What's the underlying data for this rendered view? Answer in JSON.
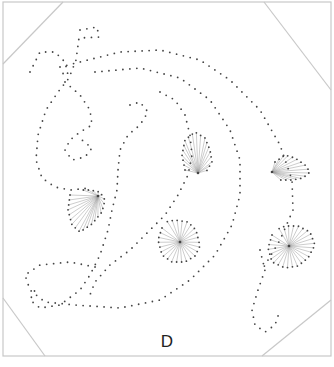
{
  "pattern": {
    "letter_label": "D",
    "colors": {
      "frame": "#c8c8c8",
      "dot": "#444444",
      "thread": "#9a9a9a",
      "background": "#ffffff"
    },
    "frame": {
      "x": 3,
      "y": 2,
      "w": 328,
      "h": 354,
      "corner_cuts": [
        [
          [
            3,
            64
          ],
          [
            63,
            2
          ]
        ],
        [
          [
            264,
            2
          ],
          [
            331,
            90
          ]
        ],
        [
          [
            3,
            298
          ],
          [
            45,
            356
          ]
        ],
        [
          [
            331,
            300
          ],
          [
            262,
            356
          ]
        ]
      ]
    },
    "dot_paths": [
      [
        [
          30,
          72
        ],
        [
          40,
          52
        ],
        [
          55,
          52
        ],
        [
          65,
          62
        ],
        [
          68,
          75
        ],
        [
          58,
          72
        ]
      ],
      [
        [
          80,
          30
        ],
        [
          97,
          27
        ],
        [
          99,
          37
        ],
        [
          79,
          38
        ],
        [
          76,
          60
        ],
        [
          69,
          78
        ],
        [
          58,
          92
        ],
        [
          46,
          110
        ],
        [
          38,
          135
        ],
        [
          36,
          160
        ],
        [
          42,
          178
        ],
        [
          55,
          187
        ],
        [
          70,
          190
        ],
        [
          90,
          188
        ]
      ],
      [
        [
          60,
          67
        ],
        [
          120,
          52
        ],
        [
          160,
          50
        ],
        [
          200,
          60
        ],
        [
          230,
          80
        ],
        [
          260,
          110
        ],
        [
          280,
          145
        ],
        [
          292,
          180
        ],
        [
          293,
          210
        ],
        [
          280,
          240
        ],
        [
          262,
          270
        ]
      ],
      [
        [
          95,
          72
        ],
        [
          140,
          68
        ],
        [
          180,
          78
        ],
        [
          210,
          100
        ],
        [
          230,
          130
        ],
        [
          240,
          160
        ],
        [
          240,
          195
        ],
        [
          232,
          225
        ],
        [
          215,
          255
        ],
        [
          190,
          280
        ],
        [
          160,
          300
        ],
        [
          120,
          308
        ],
        [
          75,
          305
        ],
        [
          45,
          302
        ],
        [
          30,
          290
        ],
        [
          25,
          275
        ],
        [
          40,
          265
        ],
        [
          70,
          262
        ],
        [
          100,
          268
        ]
      ],
      [
        [
          65,
          82
        ],
        [
          80,
          95
        ],
        [
          90,
          110
        ],
        [
          92,
          125
        ],
        [
          80,
          132
        ],
        [
          70,
          140
        ],
        [
          65,
          150
        ],
        [
          72,
          160
        ],
        [
          85,
          157
        ],
        [
          92,
          148
        ],
        [
          82,
          140
        ]
      ],
      [
        [
          130,
          105
        ],
        [
          140,
          102
        ],
        [
          148,
          112
        ],
        [
          140,
          125
        ],
        [
          128,
          135
        ],
        [
          120,
          150
        ],
        [
          118,
          170
        ],
        [
          117,
          190
        ],
        [
          112,
          210
        ],
        [
          108,
          230
        ],
        [
          100,
          255
        ],
        [
          90,
          275
        ],
        [
          80,
          290
        ],
        [
          60,
          305
        ],
        [
          40,
          308
        ],
        [
          30,
          300
        ],
        [
          35,
          290
        ]
      ],
      [
        [
          160,
          92
        ],
        [
          175,
          100
        ],
        [
          185,
          115
        ],
        [
          190,
          135
        ],
        [
          192,
          155
        ],
        [
          188,
          175
        ],
        [
          178,
          195
        ],
        [
          165,
          215
        ],
        [
          150,
          230
        ],
        [
          130,
          250
        ],
        [
          110,
          265
        ],
        [
          95,
          282
        ],
        [
          88,
          300
        ]
      ],
      [
        [
          260,
          250
        ],
        [
          265,
          270
        ],
        [
          258,
          290
        ],
        [
          252,
          310
        ],
        [
          255,
          325
        ],
        [
          265,
          332
        ],
        [
          275,
          325
        ],
        [
          280,
          310
        ]
      ]
    ],
    "fan_motifs": [
      {
        "hub": [
          98,
          196
        ],
        "arc": [
          [
            70,
            195
          ],
          [
            68,
            210
          ],
          [
            72,
            225
          ],
          [
            80,
            232
          ],
          [
            92,
            224
          ],
          [
            102,
            212
          ],
          [
            105,
            200
          ],
          [
            100,
            192
          ],
          [
            90,
            190
          ],
          [
            80,
            190
          ]
        ]
      },
      {
        "hub": [
          198,
          173
        ],
        "arc": [
          [
            185,
            170
          ],
          [
            182,
            155
          ],
          [
            185,
            140
          ],
          [
            195,
            132
          ],
          [
            205,
            138
          ],
          [
            210,
            150
          ],
          [
            212,
            162
          ],
          [
            206,
            172
          ]
        ]
      },
      {
        "hub": [
          272,
          172
        ],
        "arc": [
          [
            275,
            162
          ],
          [
            285,
            155
          ],
          [
            295,
            158
          ],
          [
            305,
            165
          ],
          [
            310,
            172
          ],
          [
            303,
            178
          ],
          [
            292,
            180
          ],
          [
            280,
            180
          ]
        ]
      },
      {
        "hub": [
          180,
          242
        ],
        "arc": [
          [
            162,
            228
          ],
          [
            158,
            240
          ],
          [
            162,
            255
          ],
          [
            172,
            262
          ],
          [
            185,
            262
          ],
          [
            195,
            256
          ],
          [
            200,
            246
          ],
          [
            196,
            230
          ],
          [
            188,
            222
          ],
          [
            175,
            220
          ],
          [
            165,
            222
          ]
        ]
      },
      {
        "hub": [
          289,
          246
        ],
        "arc": [
          [
            272,
            235
          ],
          [
            268,
            248
          ],
          [
            272,
            262
          ],
          [
            285,
            268
          ],
          [
            298,
            266
          ],
          [
            308,
            258
          ],
          [
            315,
            245
          ],
          [
            310,
            232
          ],
          [
            298,
            226
          ],
          [
            285,
            226
          ],
          [
            276,
            230
          ]
        ]
      }
    ]
  }
}
